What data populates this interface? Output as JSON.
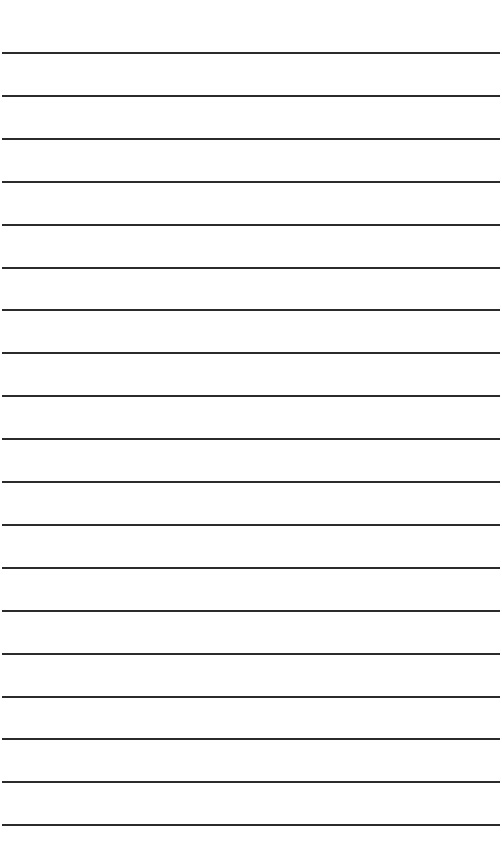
{
  "page": {
    "type": "ruled-paper",
    "background": "#ffffff",
    "line_color": "#2b2b2b",
    "line_count": 19,
    "first_line_y": 52,
    "line_spacing": 42.9
  }
}
